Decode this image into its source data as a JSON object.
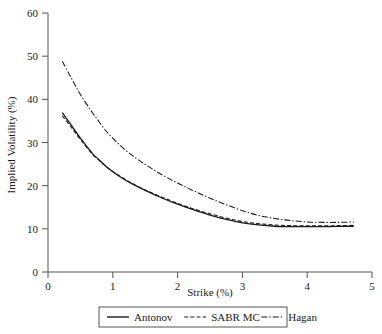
{
  "chart_data": {
    "type": "line",
    "title": "",
    "xlabel": "Strike (%)",
    "ylabel": "Implied Volatility (%)",
    "xlim": [
      0,
      5
    ],
    "ylim": [
      0,
      60
    ],
    "xticks": [
      0,
      1,
      2,
      3,
      4,
      5
    ],
    "xtick_labels": [
      "0",
      "1",
      "2",
      "3",
      "4",
      "5"
    ],
    "yticks": [
      0,
      10,
      20,
      30,
      40,
      50,
      60
    ],
    "ytick_labels": [
      "0",
      "10",
      "20",
      "30",
      "40",
      "50",
      "60"
    ],
    "grid": false,
    "legend_position": "bottom",
    "x": [
      0.22,
      0.35,
      0.5,
      0.7,
      0.75,
      0.9,
      1.1,
      1.3,
      1.5,
      1.75,
      2.0,
      2.25,
      2.5,
      2.75,
      3.0,
      3.25,
      3.5,
      3.75,
      4.0,
      4.25,
      4.5,
      4.72
    ],
    "series": [
      {
        "name": "Antonov",
        "style": "solid",
        "color": "#1a1a1a",
        "values": [
          36.9,
          34.2,
          31.0,
          27.2,
          26.5,
          24.4,
          22.2,
          20.4,
          18.9,
          17.2,
          15.7,
          14.4,
          13.2,
          12.2,
          11.4,
          10.9,
          10.6,
          10.5,
          10.5,
          10.5,
          10.55,
          10.6
        ]
      },
      {
        "name": "SABR MC",
        "style": "dashed",
        "color": "#1a1a1a",
        "values": [
          36.2,
          33.7,
          30.7,
          27.0,
          26.4,
          24.4,
          22.3,
          20.5,
          19.0,
          17.4,
          15.9,
          14.6,
          13.5,
          12.5,
          11.7,
          11.2,
          10.9,
          10.75,
          10.7,
          10.7,
          10.75,
          10.8
        ]
      },
      {
        "name": "Hagan",
        "style": "dashdot",
        "color": "#1a1a1a",
        "values": [
          48.8,
          45.2,
          41.1,
          36.6,
          35.6,
          32.6,
          29.5,
          27.0,
          24.9,
          22.6,
          20.6,
          18.8,
          17.1,
          15.6,
          14.2,
          13.1,
          12.4,
          11.9,
          11.6,
          11.5,
          11.5,
          11.6
        ]
      }
    ]
  },
  "legend": {
    "items": [
      {
        "label": "Antonov",
        "style": "solid"
      },
      {
        "label": "SABR MC",
        "style": "dashed"
      },
      {
        "label": "Hagan",
        "style": "dashdot"
      }
    ]
  },
  "axes": {
    "x_title": "Strike (%)",
    "y_title": "Implied Volatility (%)"
  }
}
